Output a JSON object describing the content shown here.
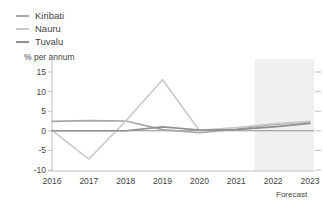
{
  "legend": {
    "position": "top-left",
    "items": [
      {
        "label": "Kiribati",
        "color": "#a8a8a8"
      },
      {
        "label": "Nauru",
        "color": "#c9c9c9"
      },
      {
        "label": "Tuvalu",
        "color": "#8f8f8f"
      }
    ]
  },
  "axes": {
    "ylabel": "% per annum",
    "yticks": [
      "15",
      "10",
      "5",
      "0",
      "-5",
      "-10"
    ],
    "xticks": [
      "2016",
      "2017",
      "2018",
      "2019",
      "2020",
      "2021",
      "2022",
      "2023"
    ]
  },
  "annotations": {
    "forecast_label": "Forecast"
  },
  "colors": {
    "background": "#ffffff",
    "text": "#3f3f3f",
    "axis": "#bfbfbf",
    "zero_line": "#8c8c8c",
    "forecast_band": "#f0f0f0"
  },
  "chart_data": {
    "type": "line",
    "title": "",
    "subtitle": "",
    "xlabel": "",
    "ylabel": "% per annum",
    "ylim": [
      -10,
      15
    ],
    "yticks": [
      15,
      10,
      5,
      0,
      -5,
      -10
    ],
    "grid": false,
    "legend_position": "top-left",
    "x": [
      "2016",
      "2017",
      "2018",
      "2019",
      "2020",
      "2021",
      "2022",
      "2023"
    ],
    "forecast_from": "2022",
    "annotations": [
      {
        "text": "Forecast",
        "x_range": [
          "2022",
          "2023"
        ],
        "position": "below-axis"
      }
    ],
    "series": [
      {
        "name": "Kiribati",
        "color": "#a8a8a8",
        "values": [
          2.4,
          2.6,
          2.5,
          0.3,
          -0.5,
          0.4,
          1.6,
          2.3
        ]
      },
      {
        "name": "Nauru",
        "color": "#c9c9c9",
        "values": [
          0.1,
          -7.2,
          2.5,
          13.0,
          0.1,
          0.8,
          1.8,
          2.4
        ]
      },
      {
        "name": "Tuvalu",
        "color": "#8f8f8f",
        "values": [
          0.0,
          0.0,
          0.0,
          1.0,
          0.2,
          0.3,
          1.0,
          1.9
        ]
      }
    ]
  }
}
